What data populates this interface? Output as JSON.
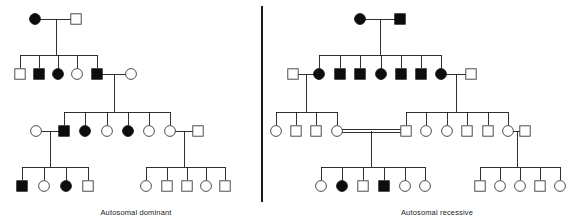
{
  "figure": {
    "title_left": "Autosomal dominant",
    "title_right": "Autosomal recessive",
    "colors": {
      "line": "#1a1a1a",
      "symbol_open_stroke": "#3a3a3a",
      "symbol_open_fill": "#ffffff",
      "symbol_filled": "#0d0d0d",
      "background": "#ffffff"
    },
    "legend_meaning": {
      "filled": "affected individual",
      "open": "unaffected individual",
      "circle": "female",
      "square": "male",
      "double_line": "consanguineous mating"
    }
  },
  "panels": [
    {
      "id": "autosomal-dominant",
      "label": "Autosomal dominant",
      "label_x": 136,
      "label_y": 215,
      "generations": [
        {
          "id": "I",
          "y": 19,
          "individuals": [
            {
              "id": "AD-I-1",
              "x": 35,
              "shape": "circle",
              "status": "affected",
              "sex": "female"
            },
            {
              "id": "AD-I-2",
              "x": 76,
              "shape": "square",
              "status": "unaffected",
              "sex": "male"
            }
          ]
        },
        {
          "id": "II",
          "y": 74,
          "individuals": [
            {
              "id": "AD-II-1",
              "x": 20,
              "shape": "square",
              "status": "unaffected",
              "sex": "male"
            },
            {
              "id": "AD-II-2",
              "x": 39,
              "shape": "square",
              "status": "affected",
              "sex": "male"
            },
            {
              "id": "AD-II-3",
              "x": 58,
              "shape": "circle",
              "status": "affected",
              "sex": "female"
            },
            {
              "id": "AD-II-4",
              "x": 77,
              "shape": "circle",
              "status": "unaffected",
              "sex": "female"
            },
            {
              "id": "AD-II-5",
              "x": 97,
              "shape": "square",
              "status": "affected",
              "sex": "male"
            },
            {
              "id": "AD-II-6",
              "x": 131,
              "shape": "circle",
              "status": "unaffected",
              "sex": "female"
            }
          ]
        },
        {
          "id": "III",
          "y": 131,
          "individuals": [
            {
              "id": "AD-III-1",
              "x": 36,
              "shape": "circle",
              "status": "unaffected",
              "sex": "female"
            },
            {
              "id": "AD-III-2",
              "x": 64,
              "shape": "square",
              "status": "affected",
              "sex": "male"
            },
            {
              "id": "AD-III-3",
              "x": 85,
              "shape": "circle",
              "status": "affected",
              "sex": "female"
            },
            {
              "id": "AD-III-4",
              "x": 107,
              "shape": "circle",
              "status": "unaffected",
              "sex": "female"
            },
            {
              "id": "AD-III-5",
              "x": 128,
              "shape": "circle",
              "status": "affected",
              "sex": "female"
            },
            {
              "id": "AD-III-6",
              "x": 149,
              "shape": "circle",
              "status": "unaffected",
              "sex": "female"
            },
            {
              "id": "AD-III-7",
              "x": 170,
              "shape": "circle",
              "status": "unaffected",
              "sex": "female"
            },
            {
              "id": "AD-III-8",
              "x": 198,
              "shape": "square",
              "status": "unaffected",
              "sex": "male"
            }
          ]
        },
        {
          "id": "IV",
          "y": 186,
          "individuals": [
            {
              "id": "AD-IV-1",
              "x": 22,
              "shape": "square",
              "status": "affected",
              "sex": "male"
            },
            {
              "id": "AD-IV-2",
              "x": 44,
              "shape": "circle",
              "status": "unaffected",
              "sex": "female"
            },
            {
              "id": "AD-IV-3",
              "x": 66,
              "shape": "circle",
              "status": "affected",
              "sex": "female"
            },
            {
              "id": "AD-IV-4",
              "x": 88,
              "shape": "square",
              "status": "unaffected",
              "sex": "male"
            },
            {
              "id": "AD-IV-5",
              "x": 146,
              "shape": "circle",
              "status": "unaffected",
              "sex": "female"
            },
            {
              "id": "AD-IV-6",
              "x": 167,
              "shape": "square",
              "status": "unaffected",
              "sex": "male"
            },
            {
              "id": "AD-IV-7",
              "x": 187,
              "shape": "square",
              "status": "unaffected",
              "sex": "male"
            },
            {
              "id": "AD-IV-8",
              "x": 206,
              "shape": "circle",
              "status": "unaffected",
              "sex": "female"
            },
            {
              "id": "AD-IV-9",
              "x": 225,
              "shape": "square",
              "status": "unaffected",
              "sex": "male"
            }
          ]
        }
      ],
      "matings": [
        {
          "id": "AD-M1",
          "type": "single",
          "x1": 35,
          "x2": 76,
          "y": 19,
          "drop_x": 56,
          "drop_y": 55
        },
        {
          "id": "AD-M2",
          "type": "single",
          "x1": 97,
          "x2": 131,
          "y": 74,
          "drop_x": 114,
          "drop_y": 112
        },
        {
          "id": "AD-M3",
          "type": "single",
          "x1": 36,
          "x2": 64,
          "y": 131,
          "drop_x": 50,
          "drop_y": 167
        },
        {
          "id": "AD-M4",
          "type": "single",
          "x1": 170,
          "x2": 198,
          "y": 131,
          "drop_x": 184,
          "drop_y": 167
        }
      ],
      "sibships": [
        {
          "id": "AD-S1",
          "bar_y": 55,
          "parent_x": 56,
          "parent_y": 19,
          "children_x": [
            20,
            39,
            58,
            77,
            97
          ],
          "child_y": 74
        },
        {
          "id": "AD-S2",
          "bar_y": 112,
          "parent_x": 114,
          "parent_y": 74,
          "children_x": [
            64,
            85,
            107,
            128,
            149,
            170
          ],
          "child_y": 131
        },
        {
          "id": "AD-S3",
          "bar_y": 167,
          "parent_x": 50,
          "parent_y": 131,
          "children_x": [
            22,
            44,
            66,
            88
          ],
          "child_y": 186
        },
        {
          "id": "AD-S4",
          "bar_y": 167,
          "parent_x": 184,
          "parent_y": 131,
          "children_x": [
            146,
            167,
            187,
            206,
            225
          ],
          "child_y": 186
        }
      ]
    },
    {
      "id": "autosomal-recessive",
      "label": "Autosomal recessive",
      "label_x": 437,
      "label_y": 215,
      "generations": [
        {
          "id": "I",
          "y": 19,
          "individuals": [
            {
              "id": "AR-I-1",
              "x": 360,
              "shape": "circle",
              "status": "affected",
              "sex": "female"
            },
            {
              "id": "AR-I-2",
              "x": 400,
              "shape": "square",
              "status": "affected",
              "sex": "male"
            }
          ]
        },
        {
          "id": "II",
          "y": 74,
          "individuals": [
            {
              "id": "AR-II-0",
              "x": 293,
              "shape": "square",
              "status": "unaffected",
              "sex": "male"
            },
            {
              "id": "AR-II-1",
              "x": 319,
              "shape": "circle",
              "status": "affected",
              "sex": "female"
            },
            {
              "id": "AR-II-2",
              "x": 340,
              "shape": "square",
              "status": "affected",
              "sex": "male"
            },
            {
              "id": "AR-II-3",
              "x": 360,
              "shape": "square",
              "status": "affected",
              "sex": "male"
            },
            {
              "id": "AR-II-4",
              "x": 381,
              "shape": "circle",
              "status": "affected",
              "sex": "female"
            },
            {
              "id": "AR-II-5",
              "x": 401,
              "shape": "square",
              "status": "affected",
              "sex": "male"
            },
            {
              "id": "AR-II-6",
              "x": 421,
              "shape": "square",
              "status": "affected",
              "sex": "male"
            },
            {
              "id": "AR-II-7",
              "x": 441,
              "shape": "circle",
              "status": "affected",
              "sex": "female"
            },
            {
              "id": "AR-II-8",
              "x": 471,
              "shape": "square",
              "status": "unaffected",
              "sex": "male"
            }
          ]
        },
        {
          "id": "III",
          "y": 131,
          "individuals": [
            {
              "id": "AR-III-1",
              "x": 276,
              "shape": "circle",
              "status": "unaffected",
              "sex": "female"
            },
            {
              "id": "AR-III-2",
              "x": 296,
              "shape": "square",
              "status": "unaffected",
              "sex": "male"
            },
            {
              "id": "AR-III-3",
              "x": 316,
              "shape": "square",
              "status": "unaffected",
              "sex": "male"
            },
            {
              "id": "AR-III-4",
              "x": 337,
              "shape": "circle",
              "status": "unaffected",
              "sex": "female"
            },
            {
              "id": "AR-III-5",
              "x": 406,
              "shape": "square",
              "status": "unaffected",
              "sex": "male"
            },
            {
              "id": "AR-III-6",
              "x": 426,
              "shape": "circle",
              "status": "unaffected",
              "sex": "female"
            },
            {
              "id": "AR-III-7",
              "x": 447,
              "shape": "circle",
              "status": "unaffected",
              "sex": "female"
            },
            {
              "id": "AR-III-8",
              "x": 467,
              "shape": "square",
              "status": "unaffected",
              "sex": "male"
            },
            {
              "id": "AR-III-9",
              "x": 488,
              "shape": "square",
              "status": "unaffected",
              "sex": "male"
            },
            {
              "id": "AR-III-10",
              "x": 508,
              "shape": "circle",
              "status": "unaffected",
              "sex": "female"
            },
            {
              "id": "AR-III-11",
              "x": 525,
              "shape": "square",
              "status": "unaffected",
              "sex": "male"
            }
          ]
        },
        {
          "id": "IV",
          "y": 186,
          "individuals": [
            {
              "id": "AR-IV-1",
              "x": 321,
              "shape": "circle",
              "status": "unaffected",
              "sex": "female"
            },
            {
              "id": "AR-IV-2",
              "x": 342,
              "shape": "circle",
              "status": "affected",
              "sex": "female"
            },
            {
              "id": "AR-IV-3",
              "x": 363,
              "shape": "square",
              "status": "unaffected",
              "sex": "male"
            },
            {
              "id": "AR-IV-4",
              "x": 384,
              "shape": "square",
              "status": "affected",
              "sex": "male"
            },
            {
              "id": "AR-IV-5",
              "x": 405,
              "shape": "circle",
              "status": "unaffected",
              "sex": "female"
            },
            {
              "id": "AR-IV-6",
              "x": 425,
              "shape": "circle",
              "status": "unaffected",
              "sex": "female"
            },
            {
              "id": "AR-IV-7",
              "x": 480,
              "shape": "square",
              "status": "unaffected",
              "sex": "male"
            },
            {
              "id": "AR-IV-8",
              "x": 500,
              "shape": "circle",
              "status": "unaffected",
              "sex": "female"
            },
            {
              "id": "AR-IV-9",
              "x": 520,
              "shape": "circle",
              "status": "unaffected",
              "sex": "female"
            },
            {
              "id": "AR-IV-10",
              "x": 540,
              "shape": "square",
              "status": "unaffected",
              "sex": "male"
            },
            {
              "id": "AR-IV-11",
              "x": 560,
              "shape": "circle",
              "status": "unaffected",
              "sex": "female"
            }
          ]
        }
      ],
      "matings": [
        {
          "id": "AR-M1",
          "type": "single",
          "x1": 360,
          "x2": 400,
          "y": 19,
          "drop_x": 380,
          "drop_y": 55
        },
        {
          "id": "AR-M2",
          "type": "single",
          "x1": 293,
          "x2": 319,
          "y": 74,
          "drop_x": 306,
          "drop_y": 112
        },
        {
          "id": "AR-M3",
          "type": "single",
          "x1": 441,
          "x2": 471,
          "y": 74,
          "drop_x": 456,
          "drop_y": 112
        },
        {
          "id": "AR-M4",
          "type": "consanguineous",
          "x1": 337,
          "x2": 406,
          "y": 131,
          "drop_x": 371,
          "drop_y": 167
        },
        {
          "id": "AR-M5",
          "type": "single",
          "x1": 508,
          "x2": 525,
          "y": 131,
          "drop_x": 517,
          "drop_y": 167
        }
      ],
      "sibships": [
        {
          "id": "AR-S1",
          "bar_y": 55,
          "parent_x": 380,
          "parent_y": 19,
          "children_x": [
            319,
            340,
            360,
            381,
            401,
            421,
            441
          ],
          "child_y": 74
        },
        {
          "id": "AR-S2",
          "bar_y": 112,
          "parent_x": 306,
          "parent_y": 74,
          "children_x": [
            276,
            296,
            316,
            337
          ],
          "child_y": 131
        },
        {
          "id": "AR-S3",
          "bar_y": 112,
          "parent_x": 456,
          "parent_y": 74,
          "children_x": [
            406,
            426,
            447,
            467,
            488,
            508
          ],
          "child_y": 131
        },
        {
          "id": "AR-S4",
          "bar_y": 167,
          "parent_x": 371,
          "parent_y": 131,
          "children_x": [
            321,
            342,
            363,
            384,
            405,
            425
          ],
          "child_y": 186
        },
        {
          "id": "AR-S5",
          "bar_y": 167,
          "parent_x": 517,
          "parent_y": 131,
          "children_x": [
            480,
            500,
            520,
            540,
            560
          ],
          "child_y": 186
        }
      ]
    }
  ],
  "divider": {
    "id": "panel-divider",
    "x": 262,
    "y1": 6,
    "y2": 202
  },
  "symbol_size": {
    "circle_r": 5.4,
    "square_side": 10.4
  }
}
